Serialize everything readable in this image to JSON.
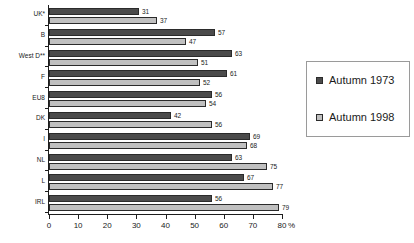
{
  "chart_data": {
    "type": "bar",
    "orientation": "horizontal",
    "title": "",
    "xlabel": "%",
    "ylabel": "",
    "xlim": [
      0,
      80
    ],
    "xticks": [
      0,
      10,
      20,
      30,
      40,
      50,
      60,
      70,
      80
    ],
    "grid": false,
    "legend_position": "right",
    "categories": [
      "UK*",
      "B",
      "West D**",
      "F",
      "EU8",
      "DK",
      "I",
      "NL",
      "L",
      "IRL"
    ],
    "series": [
      {
        "name": "Autumn 1973",
        "color": "#4b4b4b",
        "values": [
          31,
          57,
          63,
          61,
          56,
          42,
          69,
          63,
          67,
          56
        ]
      },
      {
        "name": "Autumn 1998",
        "color": "#c0c0c0",
        "values": [
          37,
          47,
          51,
          52,
          54,
          56,
          68,
          75,
          77,
          79
        ]
      }
    ]
  },
  "axis": {
    "unit_label": "%",
    "tick_labels": [
      "0",
      "10",
      "20",
      "30",
      "40",
      "50",
      "60",
      "70",
      "80"
    ]
  },
  "legend": {
    "entries": [
      {
        "label": "Autumn 1973"
      },
      {
        "label": "Autumn 1998"
      }
    ]
  }
}
